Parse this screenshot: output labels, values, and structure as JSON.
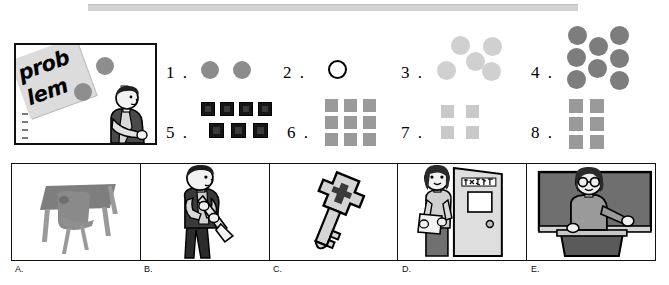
{
  "top_bar": {
    "name": "gray-divider-bar",
    "color": "#d2d2d2"
  },
  "problem_box": {
    "tag_line_1": "prob",
    "tag_line_2": "lem",
    "tag_color": "#dcdcdc",
    "dot_color": "#8e8e8e",
    "border_color": "#111111"
  },
  "items": [
    {
      "number": "1 .",
      "shape": "circle",
      "count": 2,
      "fill": "#8c8c8c",
      "arrangement": "row-of-2"
    },
    {
      "number": "2 .",
      "shape": "circle-outline",
      "count": 1,
      "fill": "#ffffff",
      "arrangement": "single"
    },
    {
      "number": "3 .",
      "shape": "circle",
      "count": 5,
      "fill": "#d0d0d0",
      "arrangement": "die-5"
    },
    {
      "number": "4 .",
      "shape": "circle",
      "count": 8,
      "fill": "#7d7d7d",
      "arrangement": "3-2-3-columns"
    },
    {
      "number": "5 .",
      "shape": "square",
      "count": 7,
      "fill": "#161616",
      "arrangement": "4-over-3"
    },
    {
      "number": "6 .",
      "shape": "square",
      "count": 9,
      "fill": "#9a9a9a",
      "arrangement": "grid-3x3"
    },
    {
      "number": "7 .",
      "shape": "square",
      "count": 4,
      "fill": "#c9c9c9",
      "arrangement": "grid-2x2"
    },
    {
      "number": "8 .",
      "shape": "square",
      "count": 6,
      "fill": "#9a9a9a",
      "arrangement": "grid-3x2"
    }
  ],
  "panels": [
    {
      "label": "A.",
      "scene": "empty-desk-and-chair"
    },
    {
      "label": "B.",
      "scene": "boy-playing-clarinet"
    },
    {
      "label": "C.",
      "scene": "key"
    },
    {
      "label": "D.",
      "scene": "woman-with-clipboard-at-door"
    },
    {
      "label": "E.",
      "scene": "teacher-pointing-at-blackboard"
    }
  ]
}
